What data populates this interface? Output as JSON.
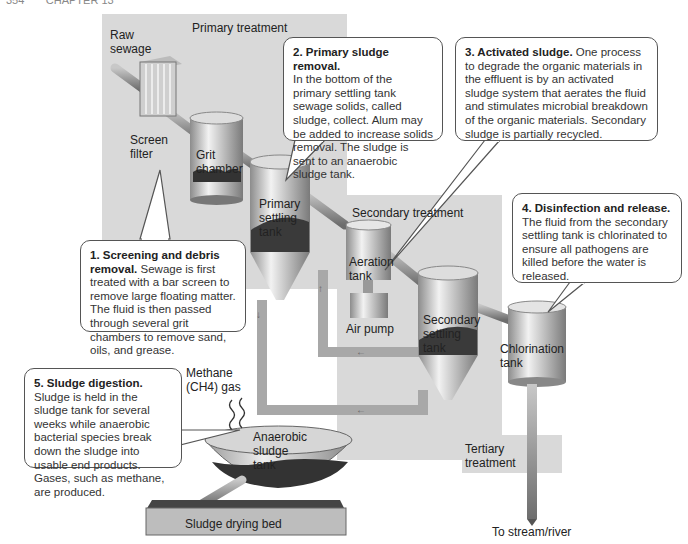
{
  "header": {
    "page_number": "354",
    "chapter": "CHAPTER 13"
  },
  "regions": {
    "primary": "Primary treatment",
    "secondary": "Secondary treatment",
    "tertiary": "Tertiary treatment"
  },
  "labels": {
    "raw_sewage": "Raw sewage",
    "screen_filter": "Screen filter",
    "grit_chamber": "Grit chamber",
    "primary_settling_tank": "Primary settling tank",
    "aeration_tank": "Aeration tank",
    "air_pump": "Air pump",
    "secondary_settling_tank": "Secondary settling tank",
    "chlorination_tank": "Chlorination tank",
    "methane_gas": "Methane (CH4) gas",
    "anaerobic_sludge_tank": "Anaerobic sludge tank",
    "sludge_drying_bed": "Sludge drying bed",
    "outflow": "To stream/river"
  },
  "callouts": [
    {
      "step": "1",
      "title": "1. Screening and debris removal.",
      "body": "Sewage is first treated with a bar screen to remove large floating matter. The fluid is then passed through several grit chambers to remove sand, oils, and grease."
    },
    {
      "step": "2",
      "title": "2. Primary sludge removal.",
      "body": "In the bottom of the primary settling tank sewage solids, called sludge, collect. Alum may be added to increase solids removal. The sludge is sent to an anaerobic sludge tank."
    },
    {
      "step": "3",
      "title": "3. Activated sludge.",
      "body": "One process to degrade the organic materials in the effluent is by an activated sludge system that aerates the fluid and stimulates microbial breakdown of the organic materials. Secondary sludge is partially recycled."
    },
    {
      "step": "4",
      "title": "4. Disinfection and release.",
      "body": "The fluid from the secondary settling tank is chlorinated to ensure all pathogens are killed before the water is released."
    },
    {
      "step": "5",
      "title": "5. Sludge digestion.",
      "body": "Sludge is held in the sludge tank for several weeks while anaerobic bacterial species break down the sludge into usable end products. Gases, such as methane, are produced."
    }
  ],
  "colors": {
    "panel": "#d9d9d9",
    "pipe": "#9a9a9a",
    "sludge": "#444444",
    "callout_border": "#555555"
  }
}
